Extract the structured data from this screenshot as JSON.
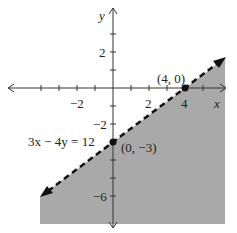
{
  "graph": {
    "equation_label": "3x − 4y = 12",
    "axis_labels": {
      "x": "x",
      "y": "y"
    },
    "x_tick_labels": [
      {
        "value": -2,
        "label": "−2"
      },
      {
        "value": 2,
        "label": "2"
      },
      {
        "value": 4,
        "label": "4"
      }
    ],
    "y_tick_labels": [
      {
        "value": 2,
        "label": "2"
      },
      {
        "value": -2,
        "label": "−2"
      },
      {
        "value": -6,
        "label": "−6"
      }
    ],
    "points": [
      {
        "label": "(4, 0)",
        "x": 4,
        "y": 0
      },
      {
        "label": "(0, −3)",
        "x": 0,
        "y": -3
      }
    ],
    "boundary": {
      "style": "dashed",
      "equation": "3x - 4y = 12"
    },
    "shaded_region": "below boundary line (3x - 4y > 12)",
    "colors": {
      "shade": "#a9a9a9",
      "line": "#111111",
      "axis": "#333333"
    }
  }
}
